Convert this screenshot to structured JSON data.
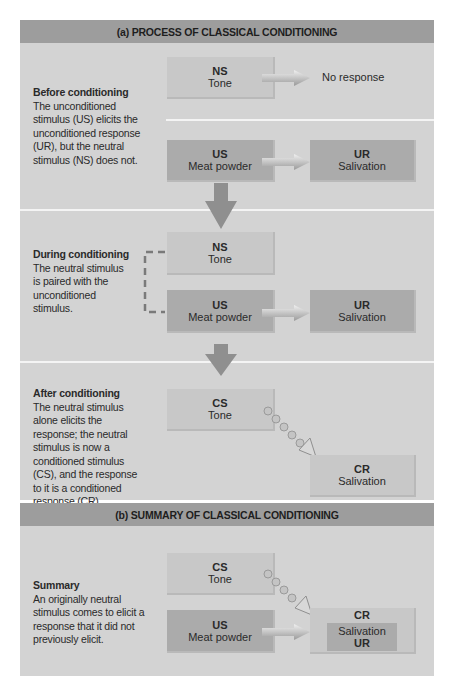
{
  "figure": {
    "colors": {
      "panel_bg": "#d3d3d3",
      "header_bg": "#9d9d9d",
      "box_light": "#c8c8c8",
      "box_dark": "#ababab",
      "arrow": "#8f8f8f",
      "divider": "#f4f4f4"
    },
    "part_a": {
      "header": "(a) PROCESS OF CLASSICAL CONDITIONING",
      "before": {
        "title": "Before conditioning",
        "text": "The unconditioned stimulus (US) elicits the unconditioned response (UR), but the neutral stimulus (NS) does not.",
        "ns_box": {
          "abbr": "NS",
          "label": "Tone"
        },
        "no_response": "No response",
        "us_box": {
          "abbr": "US",
          "label": "Meat powder"
        },
        "ur_box": {
          "abbr": "UR",
          "label": "Salivation"
        }
      },
      "during": {
        "title": "During conditioning",
        "text": "The neutral stimulus is paired with the unconditioned stimulus.",
        "ns_box": {
          "abbr": "NS",
          "label": "Tone"
        },
        "us_box": {
          "abbr": "US",
          "label": "Meat powder"
        },
        "ur_box": {
          "abbr": "UR",
          "label": "Salivation"
        }
      },
      "after": {
        "title": "After conditioning",
        "text": "The neutral stimulus alone elicits the response; the neutral stimulus is now a conditioned stimulus (CS), and the response to it is a conditioned response (CR).",
        "cs_box": {
          "abbr": "CS",
          "label": "Tone"
        },
        "cr_box": {
          "abbr": "CR",
          "label": "Salivation"
        }
      }
    },
    "part_b": {
      "header": "(b) SUMMARY OF CLASSICAL CONDITIONING",
      "summary": {
        "title": "Summary",
        "text": "An originally neutral stimulus comes to elicit a response that it did not previously elicit.",
        "cs_box": {
          "abbr": "CS",
          "label": "Tone"
        },
        "us_box": {
          "abbr": "US",
          "label": "Meat powder"
        },
        "cr_box": {
          "abbr": "CR",
          "label": "Salivation",
          "sub_abbr": "UR"
        }
      }
    }
  }
}
